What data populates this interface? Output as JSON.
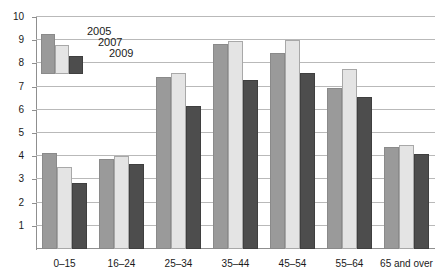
{
  "chart_data": {
    "type": "bar",
    "title": "",
    "subtitle": "",
    "xlabel": "",
    "ylabel": "",
    "ylim": [
      0,
      10
    ],
    "ytick_step": 1,
    "yticks": [
      "10",
      "9",
      "8",
      "7",
      "6",
      "5",
      "4",
      "3",
      "2",
      "1",
      "0"
    ],
    "grid": true,
    "legend_position": "top-left",
    "categories": [
      "0–15",
      "16–24",
      "25–34",
      "35–44",
      "45–54",
      "55–64",
      "65 and over"
    ],
    "series": [
      {
        "name": "2005",
        "color": "#9a9a9a",
        "values": [
          4.15,
          3.9,
          7.4,
          8.85,
          8.45,
          6.95,
          4.4
        ]
      },
      {
        "name": "2007",
        "color": "#e4e4e4",
        "values": [
          3.55,
          4.0,
          7.6,
          8.95,
          9.0,
          7.75,
          4.5
        ]
      },
      {
        "name": "2009",
        "color": "#4d4d4d",
        "values": [
          2.85,
          3.65,
          6.15,
          7.3,
          7.6,
          6.55,
          4.1
        ]
      }
    ]
  }
}
